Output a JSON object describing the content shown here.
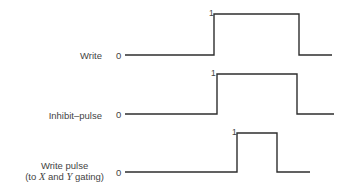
{
  "diagram": {
    "type": "timing-diagram",
    "signals": [
      {
        "name": "Write",
        "label_lines": [
          "Write"
        ],
        "low_label": "0",
        "high_label": "1",
        "start_x": 125,
        "rise_x": 214,
        "fall_x": 299,
        "end_x": 332,
        "low_y": 55,
        "high_y": 14
      },
      {
        "name": "Inhibit-pulse",
        "label_lines": [
          "Inhibit–pulse"
        ],
        "low_label": "0",
        "high_label": "1",
        "start_x": 125,
        "rise_x": 217,
        "fall_x": 297,
        "end_x": 334,
        "low_y": 114,
        "high_y": 74
      },
      {
        "name": "Write pulse",
        "label_lines": [
          "Write pulse",
          "(to X and Y gating)"
        ],
        "label_parts": {
          "prefix": "(to ",
          "x": "X",
          "mid": " and ",
          "y": "Y",
          "suffix": " gating)"
        },
        "low_label": "0",
        "high_label": "1",
        "start_x": 125,
        "rise_x": 237,
        "fall_x": 277,
        "end_x": 310,
        "low_y": 172,
        "high_y": 133
      }
    ],
    "stroke_color": "#2e2e2e"
  }
}
